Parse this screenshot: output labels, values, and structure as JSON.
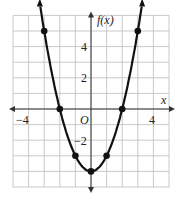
{
  "chart_data": {
    "type": "line",
    "title": "",
    "xlabel": "x",
    "ylabel": "f(x)",
    "origin_label": "O",
    "x_ticks": [
      "-4",
      "4"
    ],
    "y_ticks": [
      "4",
      "2",
      "-2"
    ],
    "xlim": [
      -5,
      5
    ],
    "ylim": [
      -5,
      6
    ],
    "grid": true,
    "series": [
      {
        "name": "f(x) = x^2 - 4",
        "x": [
          -3,
          -2,
          -1,
          0,
          1,
          2,
          3
        ],
        "y": [
          5,
          0,
          -3,
          -4,
          -3,
          0,
          5
        ]
      }
    ]
  },
  "labels": {
    "xlabel": "x",
    "ylabel": "f(x)",
    "origin": "O",
    "xtick_neg4": "−4",
    "xtick_4": "4",
    "ytick_4": "4",
    "ytick_2": "2",
    "ytick_neg2": "−2"
  }
}
